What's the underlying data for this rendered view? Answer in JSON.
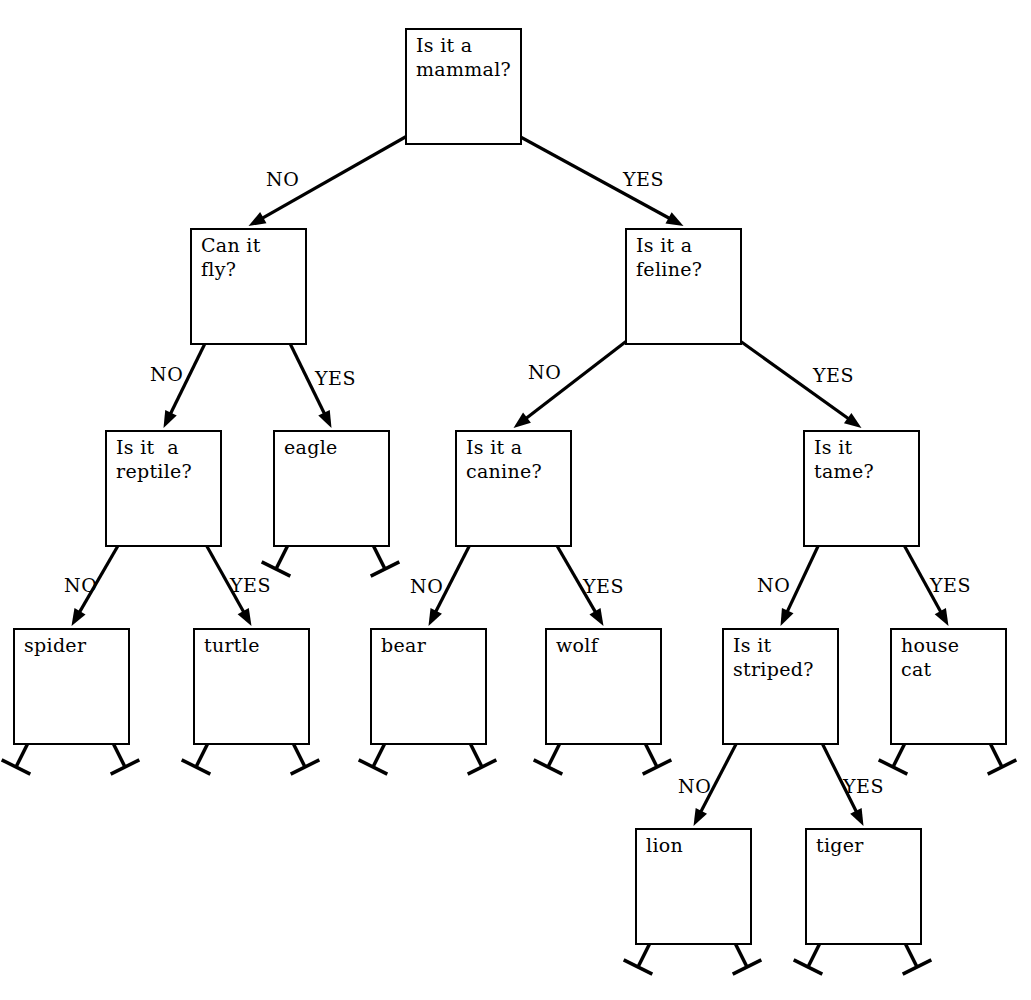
{
  "diagram": {
    "line_color": "#000000",
    "background_color": "#ffffff",
    "box_size": 117,
    "nodes": [
      {
        "id": "mammal",
        "label": "Is it a\nmammal?",
        "x": 405,
        "y": 28,
        "kind": "decision",
        "no": "fly",
        "yes": "feline"
      },
      {
        "id": "fly",
        "label": "Can it\nfly?",
        "x": 190,
        "y": 228,
        "kind": "decision",
        "no": "reptile",
        "yes": "eagle"
      },
      {
        "id": "feline",
        "label": "Is it a\nfeline?",
        "x": 625,
        "y": 228,
        "kind": "decision",
        "no": "canine",
        "yes": "tame"
      },
      {
        "id": "reptile",
        "label": "Is it  a\nreptile?",
        "x": 105,
        "y": 430,
        "kind": "decision",
        "no": "spider",
        "yes": "turtle"
      },
      {
        "id": "eagle",
        "label": "eagle",
        "x": 273,
        "y": 430,
        "kind": "leaf"
      },
      {
        "id": "canine",
        "label": "Is it a\ncanine?",
        "x": 455,
        "y": 430,
        "kind": "decision",
        "no": "bear",
        "yes": "wolf"
      },
      {
        "id": "tame",
        "label": "Is it\ntame?",
        "x": 803,
        "y": 430,
        "kind": "decision",
        "no": "striped",
        "yes": "housecat"
      },
      {
        "id": "spider",
        "label": "spider",
        "x": 13,
        "y": 628,
        "kind": "leaf"
      },
      {
        "id": "turtle",
        "label": "turtle",
        "x": 193,
        "y": 628,
        "kind": "leaf"
      },
      {
        "id": "bear",
        "label": "bear",
        "x": 370,
        "y": 628,
        "kind": "leaf"
      },
      {
        "id": "wolf",
        "label": "wolf",
        "x": 545,
        "y": 628,
        "kind": "leaf"
      },
      {
        "id": "striped",
        "label": "Is it\nstriped?",
        "x": 722,
        "y": 628,
        "kind": "decision",
        "no": "lion",
        "yes": "tiger"
      },
      {
        "id": "housecat",
        "label": "house\ncat",
        "x": 890,
        "y": 628,
        "kind": "leaf"
      },
      {
        "id": "lion",
        "label": "lion",
        "x": 635,
        "y": 828,
        "kind": "leaf"
      },
      {
        "id": "tiger",
        "label": "tiger",
        "x": 805,
        "y": 828,
        "kind": "leaf"
      }
    ],
    "edge_labels": {
      "no": "NO",
      "yes": "YES"
    },
    "edges": [
      {
        "from": "mammal",
        "to": "fly",
        "branch": "no",
        "label": "NO",
        "label_x": 266,
        "label_y": 168
      },
      {
        "from": "mammal",
        "to": "feline",
        "branch": "yes",
        "label": "YES",
        "label_x": 623,
        "label_y": 168
      },
      {
        "from": "fly",
        "to": "reptile",
        "branch": "no",
        "label": "NO",
        "label_x": 150,
        "label_y": 363
      },
      {
        "from": "fly",
        "to": "eagle",
        "branch": "yes",
        "label": "YES",
        "label_x": 315,
        "label_y": 367
      },
      {
        "from": "feline",
        "to": "canine",
        "branch": "no",
        "label": "NO",
        "label_x": 528,
        "label_y": 361
      },
      {
        "from": "feline",
        "to": "tame",
        "branch": "yes",
        "label": "YES",
        "label_x": 813,
        "label_y": 364
      },
      {
        "from": "reptile",
        "to": "spider",
        "branch": "no",
        "label": "NO",
        "label_x": 64,
        "label_y": 574
      },
      {
        "from": "reptile",
        "to": "turtle",
        "branch": "yes",
        "label": "YES",
        "label_x": 230,
        "label_y": 574
      },
      {
        "from": "canine",
        "to": "bear",
        "branch": "no",
        "label": "NO",
        "label_x": 410,
        "label_y": 575
      },
      {
        "from": "canine",
        "to": "wolf",
        "branch": "yes",
        "label": "YES",
        "label_x": 583,
        "label_y": 575
      },
      {
        "from": "tame",
        "to": "striped",
        "branch": "no",
        "label": "NO",
        "label_x": 757,
        "label_y": 574
      },
      {
        "from": "tame",
        "to": "housecat",
        "branch": "yes",
        "label": "YES",
        "label_x": 930,
        "label_y": 574
      },
      {
        "from": "striped",
        "to": "lion",
        "branch": "no",
        "label": "NO",
        "label_x": 678,
        "label_y": 775
      },
      {
        "from": "striped",
        "to": "tiger",
        "branch": "yes",
        "label": "YES",
        "label_x": 843,
        "label_y": 775
      }
    ],
    "legend": {
      "decision_note": "decision node with two connector dots at bottom",
      "leaf_note": "terminal node with two stub connectors ending in crossbars"
    }
  }
}
